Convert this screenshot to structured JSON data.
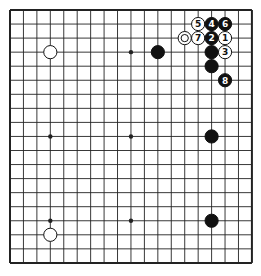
{
  "board": {
    "size": 19,
    "origin_x": 10,
    "origin_y": 10,
    "spacing_x": 13.44,
    "spacing_y": 14.05,
    "line_color": "#222222",
    "border_width": 2,
    "line_width": 0.9,
    "star_points": [
      [
        3,
        3
      ],
      [
        9,
        3
      ],
      [
        15,
        3
      ],
      [
        3,
        9
      ],
      [
        9,
        9
      ],
      [
        15,
        9
      ],
      [
        3,
        15
      ],
      [
        9,
        15
      ],
      [
        15,
        15
      ]
    ]
  },
  "stones": [
    {
      "color": "white",
      "col": 3,
      "row": 3,
      "label": ""
    },
    {
      "color": "black",
      "col": 11,
      "row": 3,
      "label": ""
    },
    {
      "color": "white",
      "col": 14,
      "row": 1,
      "label": "5"
    },
    {
      "color": "black",
      "col": 15,
      "row": 1,
      "label": "4"
    },
    {
      "color": "black",
      "col": 16,
      "row": 1,
      "label": "6"
    },
    {
      "color": "white",
      "col": 13,
      "row": 2,
      "label": "",
      "marker": "circle"
    },
    {
      "color": "white",
      "col": 14,
      "row": 2,
      "label": "7"
    },
    {
      "color": "black",
      "col": 15,
      "row": 2,
      "label": "2"
    },
    {
      "color": "white",
      "col": 16,
      "row": 2,
      "label": "1"
    },
    {
      "color": "black",
      "col": 15,
      "row": 3,
      "label": ""
    },
    {
      "color": "white",
      "col": 16,
      "row": 3,
      "label": "3"
    },
    {
      "color": "black",
      "col": 15,
      "row": 4,
      "label": ""
    },
    {
      "color": "black",
      "col": 16,
      "row": 5,
      "label": "8"
    },
    {
      "color": "black",
      "col": 15,
      "row": 9,
      "label": ""
    },
    {
      "color": "black",
      "col": 15,
      "row": 15,
      "label": ""
    },
    {
      "color": "white",
      "col": 3,
      "row": 16,
      "label": ""
    }
  ]
}
